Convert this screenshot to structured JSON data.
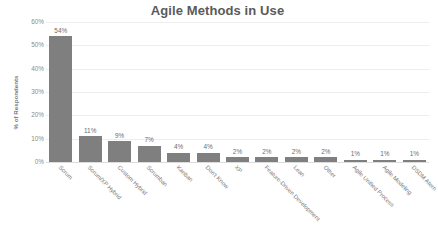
{
  "chart_data": {
    "type": "bar",
    "title": "Agile Methods in Use",
    "xlabel": "",
    "ylabel": "% of Respondents",
    "ylim": [
      0,
      60
    ],
    "ytick_labels": [
      "0%",
      "10%",
      "20%",
      "30%",
      "40%",
      "50%",
      "60%"
    ],
    "ytick_values": [
      0,
      10,
      20,
      30,
      40,
      50,
      60
    ],
    "grid": true,
    "legend": false,
    "bar_color": "#7f7f7f",
    "categories": [
      "Scrum",
      "Scrum/XP Hybrid",
      "Custom Hybrid",
      "Scrumban",
      "Kanban",
      "Don't Know",
      "XP",
      "Feature-Driven Development",
      "Lean",
      "Other",
      "Agile Unified Process",
      "Agile Modeling",
      "DSDM Atern"
    ],
    "values": [
      54,
      11,
      9,
      7,
      4,
      4,
      2,
      2,
      2,
      2,
      1,
      1,
      1
    ],
    "data_labels": [
      "54%",
      "11%",
      "9%",
      "7%",
      "4%",
      "4%",
      "2%",
      "2%",
      "2%",
      "2%",
      "1%",
      "1%",
      "1%"
    ]
  },
  "colors": {
    "background": "#ffffff",
    "bar": "#7f7f7f",
    "gridline": "#ededed",
    "title_text": "#5a5a5a",
    "axis_text": "#8a8a8a"
  }
}
